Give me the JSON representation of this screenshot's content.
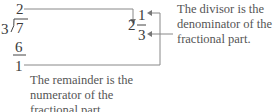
{
  "division": {
    "divisor": "3",
    "dividend": "7",
    "quotient": "2",
    "product": "6",
    "remainder": "1"
  },
  "mixed_number": {
    "whole": "2",
    "numerator": "1",
    "denominator": "3"
  },
  "annotations": {
    "divisor_note": [
      "The divisor is the",
      "denominator of the",
      "fractional part."
    ],
    "remainder_note": [
      "The remainder is the",
      "numerator of the",
      "fractional part."
    ]
  },
  "colors": {
    "text": "#3a3a3a",
    "lines": "#777777"
  }
}
